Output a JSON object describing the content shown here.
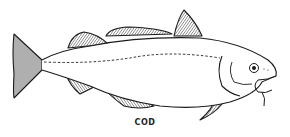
{
  "illustration": {
    "subject": "cod fish",
    "caption": "COD",
    "line_color": "#1a1a1a",
    "background": "#ffffff"
  }
}
